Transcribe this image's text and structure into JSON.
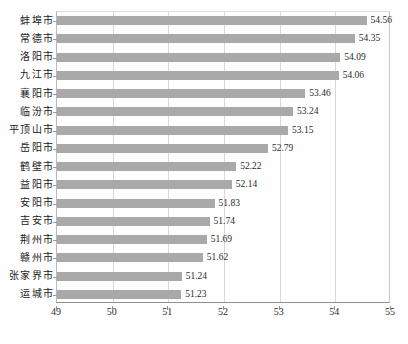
{
  "chart_data": {
    "type": "bar",
    "orientation": "horizontal",
    "title": "",
    "xlabel": "",
    "ylabel": "",
    "xlim": [
      49,
      55
    ],
    "xticks": [
      49,
      50,
      51,
      52,
      53,
      54,
      55
    ],
    "grid": true,
    "legend": false,
    "bar_color": "#a9a9a9",
    "categories": [
      "蚌埠市",
      "常德市",
      "洛阳市",
      "九江市",
      "襄阳市",
      "临汾市",
      "平顶山市",
      "岳阳市",
      "鹤壁市",
      "益阳市",
      "安阳市",
      "吉安市",
      "荆州市",
      "赣州市",
      "张家界市",
      "运城市"
    ],
    "values": [
      54.56,
      54.35,
      54.09,
      54.06,
      53.46,
      53.24,
      53.15,
      52.79,
      52.22,
      52.14,
      51.83,
      51.74,
      51.69,
      51.62,
      51.24,
      51.23
    ],
    "value_labels": [
      "54.56",
      "54.35",
      "54.09",
      "54.06",
      "53.46",
      "53.24",
      "53.15",
      "52.79",
      "52.22",
      "52.14",
      "51.83",
      "51.74",
      "51.69",
      "51.62",
      "51.24",
      "51.23"
    ],
    "xtick_labels": [
      "49",
      "50",
      "51",
      "52",
      "53",
      "54",
      "55"
    ]
  }
}
